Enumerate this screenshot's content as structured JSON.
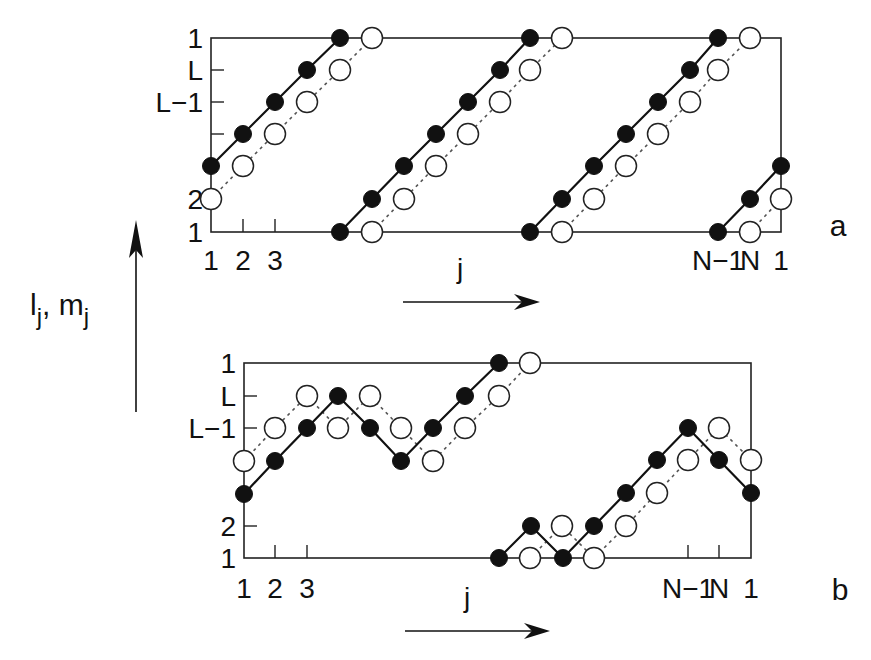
{
  "figure": {
    "y_axis_label": {
      "base1": "l",
      "sub1": "j",
      "sep": ", ",
      "base2": "m",
      "sub2": "j"
    },
    "x_axis_label": "j",
    "panels": [
      {
        "id": "a",
        "label": "a",
        "box": {
          "left": 211,
          "right": 781,
          "top": 38,
          "bottom": 232
        },
        "y_ticks": [
          {
            "label": "1",
            "y": 38,
            "tick": false
          },
          {
            "label": "L",
            "y": 70,
            "tick": true
          },
          {
            "label": "L−1",
            "y": 102,
            "tick": true
          },
          {
            "label": "",
            "y": 134,
            "tick": true
          },
          {
            "label": "2",
            "y": 199,
            "tick": false
          },
          {
            "label": "1",
            "y": 232,
            "tick": false
          }
        ],
        "x_ticks": [
          243,
          275
        ],
        "x_tick_labels": [
          {
            "label": "1",
            "x": 211
          },
          {
            "label": "2",
            "x": 243
          },
          {
            "label": "3",
            "x": 275
          },
          {
            "label": "N−1",
            "x": 718
          },
          {
            "label": "N",
            "x": 750
          },
          {
            "label": "1",
            "x": 781
          }
        ],
        "x_label_y": 270,
        "arrow": {
          "x1": 403,
          "x2": 540,
          "y": 302,
          "label_x": 460,
          "label_y": 278
        },
        "panel_label_pos": {
          "x": 838,
          "y": 236
        },
        "filled_paths": [
          [
            [
              211,
              166
            ],
            [
              243,
              134
            ],
            [
              275,
              102
            ],
            [
              307,
              70
            ],
            [
              340,
              38
            ]
          ],
          [
            [
              340,
              232
            ],
            [
              372,
              199
            ],
            [
              404,
              166
            ],
            [
              436,
              134
            ],
            [
              468,
              102
            ],
            [
              500,
              70
            ],
            [
              530,
              38
            ]
          ],
          [
            [
              530,
              232
            ],
            [
              562,
              199
            ],
            [
              594,
              166
            ],
            [
              626,
              134
            ],
            [
              658,
              102
            ],
            [
              690,
              70
            ],
            [
              718,
              38
            ]
          ],
          [
            [
              718,
              232
            ],
            [
              750,
              199
            ],
            [
              781,
              166
            ]
          ]
        ],
        "open_paths": [
          [
            [
              211,
              199
            ],
            [
              243,
              166
            ],
            [
              275,
              134
            ],
            [
              307,
              102
            ],
            [
              340,
              70
            ],
            [
              372,
              38
            ]
          ],
          [
            [
              372,
              232
            ],
            [
              404,
              199
            ],
            [
              436,
              166
            ],
            [
              468,
              134
            ],
            [
              500,
              102
            ],
            [
              530,
              70
            ],
            [
              562,
              38
            ]
          ],
          [
            [
              562,
              232
            ],
            [
              594,
              199
            ],
            [
              626,
              166
            ],
            [
              658,
              134
            ],
            [
              690,
              102
            ],
            [
              718,
              70
            ],
            [
              750,
              38
            ]
          ],
          [
            [
              750,
              232
            ],
            [
              781,
              199
            ]
          ]
        ]
      },
      {
        "id": "b",
        "label": "b",
        "box": {
          "left": 244,
          "right": 751,
          "top": 363,
          "bottom": 558
        },
        "y_ticks": [
          {
            "label": "1",
            "y": 363,
            "tick": false
          },
          {
            "label": "L",
            "y": 396,
            "tick": true
          },
          {
            "label": "L−1",
            "y": 428,
            "tick": true
          },
          {
            "label": "2",
            "y": 526,
            "tick": true
          },
          {
            "label": "1",
            "y": 558,
            "tick": false
          }
        ],
        "x_ticks": [
          275,
          307,
          688,
          719
        ],
        "x_tick_labels": [
          {
            "label": "1",
            "x": 244
          },
          {
            "label": "2",
            "x": 275
          },
          {
            "label": "3",
            "x": 307
          },
          {
            "label": "N−1",
            "x": 688
          },
          {
            "label": "N",
            "x": 719
          },
          {
            "label": "1",
            "x": 751
          }
        ],
        "x_label_y": 598,
        "arrow": {
          "x1": 405,
          "x2": 550,
          "y": 631,
          "label_x": 467,
          "label_y": 607
        },
        "panel_label_pos": {
          "x": 840,
          "y": 600
        },
        "filled_paths": [
          [
            [
              244,
              494
            ],
            [
              275,
              461
            ],
            [
              307,
              428
            ],
            [
              338,
              396
            ],
            [
              370,
              428
            ],
            [
              401,
              461
            ],
            [
              433,
              428
            ],
            [
              465,
              396
            ],
            [
              499,
              363
            ]
          ],
          [
            [
              499,
              558
            ],
            [
              531,
              526
            ],
            [
              563,
              558
            ],
            [
              594,
              526
            ],
            [
              626,
              493
            ],
            [
              657,
              460
            ],
            [
              688,
              428
            ],
            [
              719,
              460
            ],
            [
              751,
              493
            ]
          ]
        ],
        "open_paths": [
          [
            [
              244,
              461
            ],
            [
              275,
              428
            ],
            [
              307,
              396
            ],
            [
              338,
              428
            ],
            [
              370,
              396
            ],
            [
              401,
              428
            ],
            [
              433,
              461
            ],
            [
              465,
              428
            ],
            [
              499,
              396
            ],
            [
              530,
              363
            ]
          ],
          [
            [
              530,
              558
            ],
            [
              562,
              526
            ],
            [
              594,
              558
            ],
            [
              626,
              526
            ],
            [
              657,
              493
            ],
            [
              688,
              460
            ],
            [
              719,
              428
            ],
            [
              751,
              460
            ]
          ]
        ]
      }
    ],
    "vertical_arrow": {
      "x": 136,
      "y_top": 220,
      "y_bottom": 412
    },
    "colors": {
      "ink": "#111111",
      "background": "#ffffff"
    }
  }
}
